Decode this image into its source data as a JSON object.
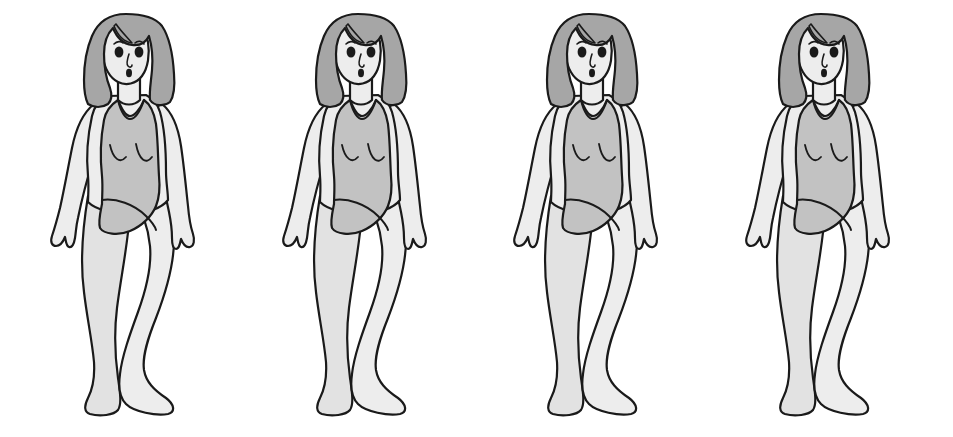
{
  "document": {
    "title": "Figure Rating Scale",
    "kind": "body-figure-rating-scale",
    "background_color": "#ffffff",
    "figure_count": 4
  },
  "palette": {
    "background": "#ffffff",
    "outline": "#1a1a1a",
    "hair": "#a6a6a6",
    "hair_shadow": "#9a9a9a",
    "skin": "#ededed",
    "skin_shade": "#e2e2e2",
    "swimsuit": "#c2c2c2",
    "swimsuit_shade": "#b6b6b6",
    "eye": "#1a1a1a",
    "mouth": "#1a1a1a"
  },
  "figures": [
    {
      "id": "figure-1",
      "label": "",
      "pose": "standing-three-quarter-left",
      "garment": "one-piece-swimsuit",
      "hair": "shoulder-length-wavy",
      "center_x": 117
    },
    {
      "id": "figure-2",
      "label": "",
      "pose": "standing-three-quarter-left",
      "garment": "one-piece-swimsuit",
      "hair": "shoulder-length-wavy",
      "center_x": 360
    },
    {
      "id": "figure-3",
      "label": "",
      "pose": "standing-three-quarter-left",
      "garment": "one-piece-swimsuit",
      "hair": "shoulder-length-wavy",
      "center_x": 626
    },
    {
      "id": "figure-4",
      "label": "",
      "pose": "standing-three-quarter-left",
      "garment": "one-piece-swimsuit",
      "hair": "shoulder-length-wavy",
      "center_x": 882
    }
  ],
  "icons": {
    "figure": "female-figure-icon",
    "hair": "hair-icon",
    "face": "face-icon",
    "swimsuit": "swimsuit-icon"
  }
}
